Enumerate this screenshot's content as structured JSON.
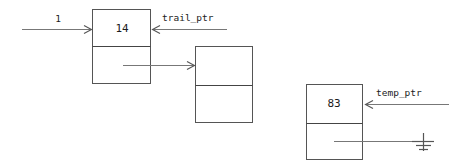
{
  "diagram": {
    "type": "linked-list",
    "background_color": "#ffffff",
    "stroke_color": "#555555",
    "line_color": "#777777",
    "text_color": "#1b1b1b"
  },
  "nodes": [
    {
      "id": "node-1",
      "value": "14",
      "has_value": true,
      "x": 92,
      "y": 9,
      "width": 59,
      "height": 75,
      "divider_y": 46
    },
    {
      "id": "node-2",
      "value": "",
      "has_value": false,
      "x": 195,
      "y": 46,
      "width": 58,
      "height": 77,
      "divider_y": 85
    },
    {
      "id": "node-3",
      "value": "83",
      "has_value": true,
      "x": 306,
      "y": 84,
      "width": 57,
      "height": 76,
      "divider_y": 123
    }
  ],
  "edges": [
    {
      "id": "entry-arrow",
      "label": "1",
      "label_x": 58,
      "label_y": 22,
      "from_x": 22,
      "to_x": 91,
      "y": 29,
      "direction": "right"
    },
    {
      "id": "node1-to-node2",
      "label": "",
      "from_x": 123,
      "to_x": 194,
      "y": 65,
      "direction": "right"
    }
  ],
  "pointers": [
    {
      "id": "trail-ptr",
      "label": "trail_ptr",
      "label_x": 162,
      "label_y": 21,
      "from_x": 227,
      "to_x": 153,
      "y": 29,
      "direction": "left",
      "target_node": "node-1"
    },
    {
      "id": "temp-ptr",
      "label": "temp_ptr",
      "label_x": 376,
      "label_y": 96,
      "from_x": 449,
      "to_x": 366,
      "y": 104,
      "direction": "left",
      "target_node": "node-3"
    }
  ],
  "ground": {
    "id": "null-ground",
    "label": "",
    "line_from_x": 334,
    "line_to_x": 423,
    "line_y": 141,
    "stem_x": 423,
    "stem_top_y": 134,
    "stem_bottom_y": 150,
    "bars": [
      {
        "half_width": 11,
        "y": 141
      },
      {
        "half_width": 7,
        "y": 145
      },
      {
        "half_width": 4,
        "y": 149
      }
    ]
  }
}
